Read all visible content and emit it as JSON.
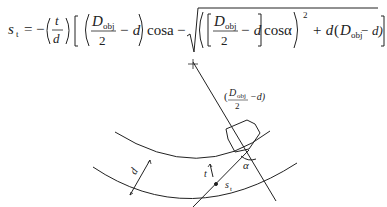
{
  "formula": {
    "lhs": "s",
    "lhs_sub": "t",
    "equals": "=",
    "minus": "−",
    "frac_t_num": "t",
    "frac_t_den": "d",
    "D": "D",
    "D_sub": "obj",
    "two": "2",
    "minus_d": "− d",
    "cos_a": "cosa",
    "cos_alpha": "cosα",
    "power": "2",
    "plus_d": "+ d",
    "tail_open": "(",
    "tail_close": "− d)",
    "latex": "s_t = -\\left(\\frac{t}{d}\\right)\\left[\\left(\\frac{D_{obj}}{2}-d\\right)\\cos a - \\sqrt{\\left(\\left[\\frac{D_{obj}}{2}-d\\right]\\cos\\alpha\\right)^2 + d\\,(D_{obj}-d)}\\right]"
  },
  "diagram": {
    "label_radius": "(",
    "label_radius_D": "D",
    "label_radius_sub": "obj",
    "label_radius_two": "2",
    "label_radius_tail": "−d)",
    "label_d": "d",
    "label_t": "t",
    "label_st": "s",
    "label_st_sub": "t",
    "label_alpha": "α"
  }
}
